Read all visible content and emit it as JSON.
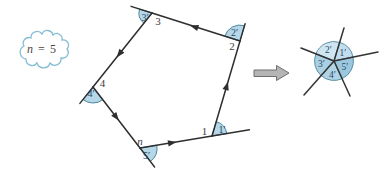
{
  "figure": {
    "cloud": {
      "variable": "n",
      "equals_value": " = 5"
    },
    "pentagon": {
      "vertices": [
        {
          "label": "1"
        },
        {
          "label": "2"
        },
        {
          "label": "3"
        },
        {
          "label": "4"
        },
        {
          "label": "n"
        }
      ],
      "exterior_angles": [
        {
          "label": "1′"
        },
        {
          "label": "2′"
        },
        {
          "label": "3′"
        },
        {
          "label": "4′"
        },
        {
          "label": "5′"
        }
      ]
    },
    "star": {
      "sectors": [
        {
          "label": "1′",
          "fill": "#c2ddee"
        },
        {
          "label": "2′",
          "fill": "#cfe6f2"
        },
        {
          "label": "3′",
          "fill": "#a9d0e3"
        },
        {
          "label": "4′",
          "fill": "#b0d4e6"
        },
        {
          "label": "5′",
          "fill": "#9cc8df"
        }
      ]
    },
    "colors": {
      "angle_fill": "#b5d7e8",
      "angle_stroke": "#4d86a0",
      "line": "#2e2e2e",
      "label": "#3d3d3d",
      "cloud_outline": "#85bdd3",
      "cloud_text": "#4a453f",
      "arrow_fill": "#b5b5b5",
      "arrow_stroke": "#6e6e6e"
    }
  }
}
